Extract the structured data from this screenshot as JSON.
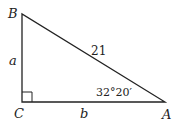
{
  "diagram": {
    "type": "right-triangle",
    "vertices": {
      "B": {
        "label": "B",
        "x": 22,
        "y": 14
      },
      "C": {
        "label": "C",
        "x": 22,
        "y": 102
      },
      "A": {
        "label": "A",
        "x": 165,
        "y": 102
      }
    },
    "sides": {
      "a": {
        "label": "a",
        "between": [
          "B",
          "C"
        ]
      },
      "b": {
        "label": "b",
        "between": [
          "C",
          "A"
        ]
      },
      "c": {
        "label": "21",
        "between": [
          "B",
          "A"
        ]
      }
    },
    "angle_A": {
      "label": "32°20′"
    },
    "right_angle_at": "C",
    "line_color": "#222222"
  }
}
